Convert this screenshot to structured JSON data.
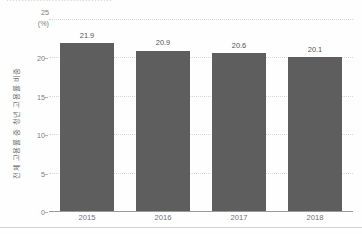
{
  "figure": {
    "title_cut": "···································",
    "unit_top": "25",
    "unit_label": "(%)",
    "y_axis_title": "전체 고용률 중 청년 고용률 비중",
    "bottom_rule": "divider"
  },
  "chart_data": {
    "type": "bar",
    "title": "",
    "xlabel": "",
    "ylabel": "전체 고용률 중 청년 고용률 비중",
    "unit": "(%)",
    "categories": [
      "2015",
      "2016",
      "2017",
      "2018"
    ],
    "values": [
      21.9,
      20.9,
      20.6,
      20.1
    ],
    "value_labels": [
      "21.9",
      "20.9",
      "20.6",
      "20.1"
    ],
    "ylim": [
      0,
      25
    ],
    "yticks": [
      0,
      5,
      10,
      15,
      20,
      25
    ],
    "ytick_labels": [
      "0",
      "5",
      "10",
      "15",
      "20",
      "25"
    ],
    "grid": true,
    "legend": "none",
    "bar_color": "#5e5e5e",
    "grid_color": "#d8d8d8",
    "axis_color": "#9a9a9a"
  }
}
